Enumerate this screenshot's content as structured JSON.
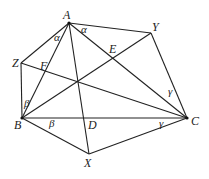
{
  "diagram": {
    "type": "geometry",
    "points": {
      "A": {
        "label": "A",
        "x": 69,
        "y": 23,
        "lx": 63,
        "ly": 19
      },
      "Y": {
        "label": "Y",
        "x": 151,
        "y": 33,
        "lx": 152,
        "ly": 31
      },
      "Z": {
        "label": "Z",
        "x": 21,
        "y": 63,
        "lx": 12,
        "ly": 67
      },
      "B": {
        "label": "B",
        "x": 22,
        "y": 118,
        "lx": 14,
        "ly": 129
      },
      "C": {
        "label": "C",
        "x": 187,
        "y": 118,
        "lx": 191,
        "ly": 125
      },
      "X": {
        "label": "X",
        "x": 89,
        "y": 154,
        "lx": 84,
        "ly": 167
      },
      "D": {
        "label": "D",
        "x": 84,
        "y": 118,
        "lx": 88,
        "ly": 129
      },
      "E": {
        "label": "E",
        "x": 113,
        "y": 58,
        "lx": 109,
        "ly": 53
      },
      "F": {
        "label": "F",
        "x": 43,
        "y": 72,
        "lx": 40,
        "ly": 70
      }
    },
    "angle_labels": [
      {
        "text": "α",
        "x": 54,
        "y": 41
      },
      {
        "text": "α",
        "x": 81,
        "y": 33
      },
      {
        "text": "β",
        "x": 24,
        "y": 107
      },
      {
        "text": "β",
        "x": 49,
        "y": 127
      },
      {
        "text": "γ",
        "x": 168,
        "y": 95
      },
      {
        "text": "γ",
        "x": 159,
        "y": 127
      }
    ],
    "segments": [
      [
        "Z",
        "A"
      ],
      [
        "A",
        "Y"
      ],
      [
        "Y",
        "C"
      ],
      [
        "C",
        "X"
      ],
      [
        "X",
        "B"
      ],
      [
        "B",
        "Z"
      ],
      [
        "B",
        "C"
      ],
      [
        "A",
        "X"
      ],
      [
        "A",
        "C"
      ],
      [
        "B",
        "Y"
      ],
      [
        "Z",
        "C"
      ],
      [
        "B",
        "A"
      ]
    ]
  }
}
